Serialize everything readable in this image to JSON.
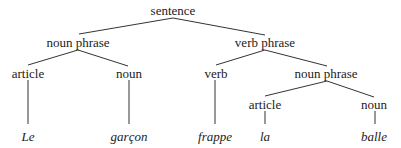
{
  "tree": {
    "root": "sentence",
    "nodes": {
      "sentence": "sentence",
      "np1": "noun phrase",
      "vp": "verb phrase",
      "art1": "article",
      "n1": "noun",
      "v": "verb",
      "np2": "noun phrase",
      "art2": "article",
      "n2": "noun"
    },
    "leaves": {
      "le": "Le",
      "garcon": "garçon",
      "frappe": "frappe",
      "la": "la",
      "balle": "balle"
    },
    "colors": {
      "text": "#222222",
      "line": "#333333",
      "background": "#ffffff"
    }
  }
}
